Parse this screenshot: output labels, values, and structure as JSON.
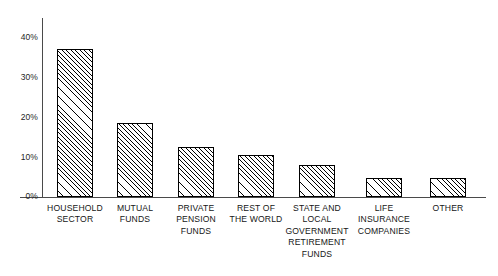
{
  "chart_data": {
    "type": "bar",
    "title": "",
    "subtitle": "",
    "xlabel": "",
    "ylabel": "",
    "ylim": [
      0,
      40
    ],
    "grid": false,
    "legend": false,
    "legend_position": "none",
    "y_ticks": [
      "0%",
      "10%",
      "20%",
      "30%",
      "40%"
    ],
    "y_tick_values": [
      0,
      10,
      20,
      30,
      40
    ],
    "categories": [
      "HOUSEHOLD\nSECTOR",
      "MUTUAL\nFUNDS",
      "PRIVATE\nPENSION\nFUNDS",
      "REST OF\nTHE WORLD",
      "STATE AND\nLOCAL\nGOVERNMENT\nRETIREMENT\nFUNDS",
      "LIFE\nINSURANCE\nCOMPANIES",
      "OTHER"
    ],
    "values": [
      37,
      18.5,
      12.5,
      10.5,
      8,
      4.8,
      4.8
    ],
    "bar_style": {
      "fill": "diagonal-hatch",
      "edge_color": "#000000",
      "face_color": "#ffffff"
    }
  },
  "axis": {
    "y_labels": [
      {
        "text": "40%",
        "value": 40
      },
      {
        "text": "30%",
        "value": 30
      },
      {
        "text": "20%",
        "value": 20
      },
      {
        "text": "10%",
        "value": 10
      },
      {
        "text": "0%",
        "value": 0
      }
    ],
    "axis_color": "#4a4a4a"
  },
  "bars": [
    {
      "label": "HOUSEHOLD\nSECTOR",
      "value": 37,
      "x": 57,
      "width": 36
    },
    {
      "label": "MUTUAL\nFUNDS",
      "value": 18.5,
      "x": 117,
      "width": 36
    },
    {
      "label": "PRIVATE\nPENSION\nFUNDS",
      "value": 12.5,
      "x": 178,
      "width": 36
    },
    {
      "label": "REST OF\nTHE WORLD",
      "value": 10.5,
      "x": 238,
      "width": 36
    },
    {
      "label": "STATE AND\nLOCAL\nGOVERNMENT\nRETIREMENT\nFUNDS",
      "value": 8,
      "x": 299,
      "width": 36
    },
    {
      "label": "LIFE\nINSURANCE\nCOMPANIES",
      "value": 4.8,
      "x": 366,
      "width": 36
    },
    {
      "label": "OTHER",
      "value": 4.8,
      "x": 430,
      "width": 36
    }
  ]
}
